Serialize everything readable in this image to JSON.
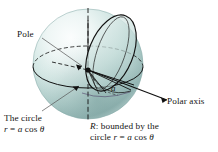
{
  "figure": {
    "type": "math-diagram",
    "background_color": "#ffffff",
    "sphere": {
      "highlight_color": "#f2f8f7",
      "mid_color": "#c9e0dd",
      "shade_color": "#7fa6a4",
      "edge_color": "#6d9a98"
    },
    "line_color": "#111111"
  },
  "labels": {
    "pole": "Pole",
    "polar_axis": "Polar axis",
    "radius": "a",
    "circle_caption_line1": "The circle",
    "circle_caption_line2_prefix": "r",
    "circle_caption_line2_eq": " = ",
    "circle_caption_line2_a": "a",
    "circle_caption_line2_rest": " cos ",
    "circle_caption_line2_theta": "θ",
    "region_caption_line1_R": "R",
    "region_caption_line1_rest": ": bounded by the",
    "region_caption_line2_prefix": "circle ",
    "region_caption_line2_r": "r",
    "region_caption_line2_eq": " = ",
    "region_caption_line2_a": "a",
    "region_caption_line2_cos": " cos ",
    "region_caption_line2_theta": "θ"
  }
}
